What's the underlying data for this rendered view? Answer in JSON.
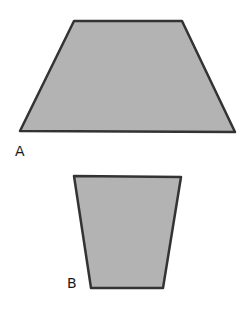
{
  "diagram": {
    "fill_color": "#b3b3b3",
    "stroke_color": "#333333",
    "shapes": [
      {
        "id": "A",
        "label": "A",
        "type": "trapezoid",
        "points": "74,21 182,21 235,132 20,131"
      },
      {
        "id": "B",
        "label": "B",
        "type": "trapezoid",
        "points": "74,176 181,177 163,288 91,288"
      }
    ]
  }
}
